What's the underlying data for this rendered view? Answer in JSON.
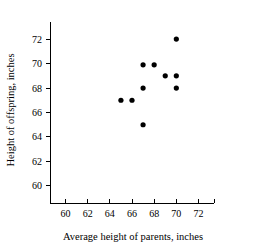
{
  "chart_data": {
    "type": "scatter",
    "title": "",
    "xlabel": "Average height of parents, inches",
    "ylabel": "Height of offspring, inches",
    "xlim": [
      58.6,
      73.4
    ],
    "ylim": [
      58.6,
      73.4
    ],
    "xticks": [
      60,
      62,
      64,
      66,
      68,
      70,
      72
    ],
    "yticks": [
      60,
      62,
      64,
      66,
      68,
      70,
      72
    ],
    "xticklabels": [
      "60",
      "62",
      "64",
      "66",
      "68",
      "70",
      "72"
    ],
    "yticklabels": [
      "60",
      "62",
      "64",
      "66",
      "68",
      "70",
      "72"
    ],
    "grid": false,
    "legend": false,
    "marker": "filled-circle",
    "marker_color": "#000000",
    "points": [
      {
        "x": 65,
        "y": 67
      },
      {
        "x": 66,
        "y": 67
      },
      {
        "x": 67,
        "y": 65
      },
      {
        "x": 67,
        "y": 68
      },
      {
        "x": 67,
        "y": 69.9
      },
      {
        "x": 68,
        "y": 69.9
      },
      {
        "x": 69,
        "y": 69
      },
      {
        "x": 70,
        "y": 68
      },
      {
        "x": 70,
        "y": 69
      },
      {
        "x": 70,
        "y": 72
      }
    ]
  },
  "axes": {
    "x_axis_name": "x-axis",
    "y_axis_name": "y-axis"
  }
}
